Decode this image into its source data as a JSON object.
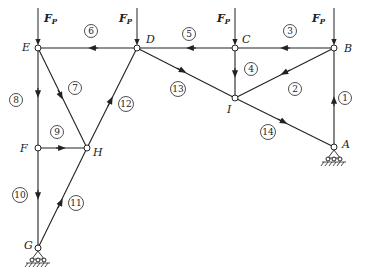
{
  "figure": {
    "nodes": [
      {
        "id": "E",
        "label": "E",
        "x": 38,
        "y": 48
      },
      {
        "id": "D",
        "label": "D",
        "x": 137,
        "y": 48
      },
      {
        "id": "C",
        "label": "C",
        "x": 235,
        "y": 48
      },
      {
        "id": "B",
        "label": "B",
        "x": 334,
        "y": 48
      },
      {
        "id": "I",
        "label": "I",
        "x": 235,
        "y": 98
      },
      {
        "id": "A",
        "label": "A",
        "x": 334,
        "y": 147
      },
      {
        "id": "F",
        "label": "F",
        "x": 38,
        "y": 148
      },
      {
        "id": "H",
        "label": "H",
        "x": 87,
        "y": 148
      },
      {
        "id": "G",
        "label": "G",
        "x": 38,
        "y": 248
      }
    ],
    "members": [
      {
        "id": "1",
        "label": "1",
        "from": "A",
        "to": "B"
      },
      {
        "id": "2",
        "label": "2",
        "from": "B",
        "to": "I"
      },
      {
        "id": "3",
        "label": "3",
        "from": "B",
        "to": "C"
      },
      {
        "id": "4",
        "label": "4",
        "from": "C",
        "to": "I"
      },
      {
        "id": "5",
        "label": "5",
        "from": "C",
        "to": "D"
      },
      {
        "id": "6",
        "label": "6",
        "from": "D",
        "to": "E"
      },
      {
        "id": "7",
        "label": "7",
        "from": "E",
        "to": "H"
      },
      {
        "id": "8",
        "label": "8",
        "from": "E",
        "to": "F"
      },
      {
        "id": "9",
        "label": "9",
        "from": "F",
        "to": "H"
      },
      {
        "id": "10",
        "label": "10",
        "from": "F",
        "to": "G"
      },
      {
        "id": "11",
        "label": "11",
        "from": "G",
        "to": "H"
      },
      {
        "id": "12",
        "label": "12",
        "from": "H",
        "to": "D"
      },
      {
        "id": "13",
        "label": "13",
        "from": "D",
        "to": "I"
      },
      {
        "id": "14",
        "label": "14",
        "from": "I",
        "to": "A"
      }
    ],
    "loads": [
      {
        "node": "E",
        "label": "F",
        "subscript": "P"
      },
      {
        "node": "D",
        "label": "F",
        "subscript": "P"
      },
      {
        "node": "C",
        "label": "F",
        "subscript": "P"
      },
      {
        "node": "B",
        "label": "F",
        "subscript": "P"
      }
    ],
    "supports": [
      {
        "node": "A",
        "type": "pin"
      },
      {
        "node": "G",
        "type": "pin"
      }
    ]
  },
  "labels": {
    "E": "E",
    "D": "D",
    "C": "C",
    "B": "B",
    "I": "I",
    "A": "A",
    "F": "F",
    "H": "H",
    "G": "G",
    "load": "F",
    "load_sub": "P",
    "m1": "1",
    "m2": "2",
    "m3": "3",
    "m4": "4",
    "m5": "5",
    "m6": "6",
    "m7": "7",
    "m8": "8",
    "m9": "9",
    "m10": "10",
    "m11": "11",
    "m12": "12",
    "m13": "13",
    "m14": "14"
  }
}
